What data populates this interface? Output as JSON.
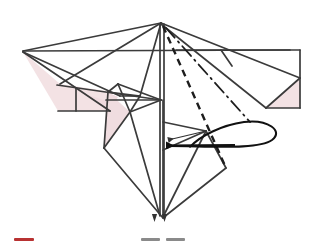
{
  "figure": {
    "type": "origami-instruction",
    "canvas": {
      "width": 317,
      "height": 243
    },
    "colors": {
      "background": "#ffffff",
      "line": "#3b3b3b",
      "line_soft": "#5a5a5a",
      "paper_front": "#ffffff",
      "paper_back": "#f3e2e4",
      "paper_back_shadow": "#ecd6d9",
      "fold_dashed": "#1d1d1d",
      "fold_dashdot": "#1d1d1d",
      "arrow": "#111111",
      "legend_red": "#b83232",
      "legend_gray": "#8a8a8a"
    },
    "geometry": {
      "apex": {
        "x": 161,
        "y": 23
      },
      "bottom_point": {
        "x": 163,
        "y": 218
      },
      "left_wing_tip": {
        "x": 22,
        "y": 51
      },
      "right_panel_corner": {
        "x": 300,
        "y": 50
      },
      "center_axis_x": 162
    }
  },
  "fold_marks": {
    "valley_fold": {
      "name": "valley-fold-line",
      "style": "dashed",
      "from": {
        "x": 163,
        "y": 26
      },
      "to": {
        "x": 226,
        "y": 168
      }
    },
    "mountain_fold": {
      "name": "mountain-fold-line",
      "style": "dash-dot",
      "from": {
        "x": 166,
        "y": 28
      },
      "to": {
        "x": 250,
        "y": 122
      }
    }
  },
  "rotation_arrow": {
    "name": "rotation-arrow",
    "direction": "left",
    "meaning": "swing the right flap around to the left",
    "tip": {
      "x": 155,
      "y": 146
    },
    "loop_right_edge": {
      "x": 277,
      "y": 140
    }
  },
  "legend": {
    "items": [
      {
        "id": "legend-valley",
        "swatch": "red-line",
        "color": "#b83232",
        "x": 14,
        "width": 20,
        "y": 24
      },
      {
        "id": "legend-mountain-a",
        "swatch": "gray-dash",
        "color": "#8a8a8a",
        "x": 141,
        "width": 19,
        "y": 24
      },
      {
        "id": "legend-mountain-b",
        "swatch": "gray-dash",
        "color": "#8a8a8a",
        "x": 166,
        "width": 19,
        "y": 24
      }
    ],
    "arrow_marker": {
      "id": "legend-arrow-glyph",
      "label": "arrow-head"
    }
  }
}
